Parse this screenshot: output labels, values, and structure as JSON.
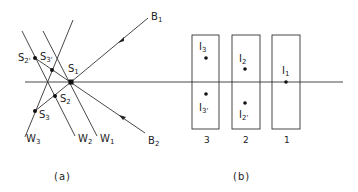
{
  "panel_a": {
    "caption": "(a)",
    "points": {
      "S1": {
        "label": "S",
        "sub": "1"
      },
      "S2": {
        "label": "S",
        "sub": "2"
      },
      "S3": {
        "label": "S",
        "sub": "3"
      },
      "S2p": {
        "label": "S",
        "sub": "2'"
      },
      "S3p": {
        "label": "S",
        "sub": "3'"
      }
    },
    "rays": {
      "B1": {
        "label": "B",
        "sub": "1"
      },
      "B2": {
        "label": "B",
        "sub": "2"
      }
    },
    "walls": {
      "W1": {
        "label": "W",
        "sub": "1"
      },
      "W2": {
        "label": "W",
        "sub": "2"
      },
      "W3": {
        "label": "W",
        "sub": "3"
      }
    }
  },
  "panel_b": {
    "caption": "(b)",
    "boxes": [
      {
        "number": "3",
        "images": [
          {
            "label": "I",
            "sub": "3"
          },
          {
            "label": "I",
            "sub": "3'"
          }
        ]
      },
      {
        "number": "2",
        "images": [
          {
            "label": "I",
            "sub": "2"
          },
          {
            "label": "I",
            "sub": "2'"
          }
        ]
      },
      {
        "number": "1",
        "images": [
          {
            "label": "I",
            "sub": "1"
          }
        ]
      }
    ]
  },
  "colors": {
    "ink": "#222222",
    "background": "#ffffff"
  }
}
